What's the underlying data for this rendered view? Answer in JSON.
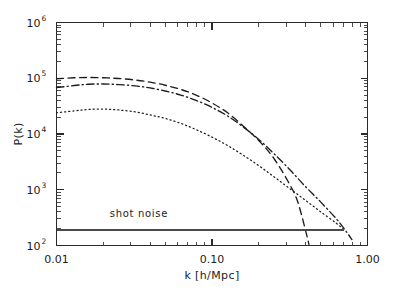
{
  "chart_data": {
    "type": "line",
    "title": "",
    "xlabel": "k [h/Mpc]",
    "ylabel": "P(k)",
    "xscale": "log",
    "yscale": "log",
    "xlim": [
      0.01,
      1.0
    ],
    "ylim": [
      100,
      1000000
    ],
    "grid": false,
    "legend_position": "none",
    "xtick_labels": [
      "0.01",
      "0.10",
      "1.00"
    ],
    "xtick_values": [
      0.01,
      0.1,
      1.0
    ],
    "ytick_labels": [
      "10",
      "10",
      "10",
      "10",
      "10"
    ],
    "ytick_exponents": [
      "2",
      "3",
      "4",
      "5",
      "6"
    ],
    "ytick_values": [
      100,
      1000,
      10000,
      100000,
      1000000
    ],
    "annotations": [
      {
        "text": "shot noise",
        "x": 0.022,
        "y": 320
      }
    ],
    "series": [
      {
        "name": "dashed-curve",
        "style": "dashed",
        "x": [
          0.01,
          0.013,
          0.016,
          0.02,
          0.025,
          0.032,
          0.04,
          0.05,
          0.063,
          0.079,
          0.1,
          0.126,
          0.158,
          0.2,
          0.251,
          0.316,
          0.355,
          0.398,
          0.42
        ],
        "y": [
          98000,
          102000,
          103000,
          102000,
          99000,
          93000,
          85000,
          75000,
          63000,
          50000,
          36000,
          24000,
          14000,
          7600,
          3600,
          1250,
          620,
          195,
          105
        ]
      },
      {
        "name": "dash-dot-curve",
        "style": "dashdot",
        "x": [
          0.01,
          0.013,
          0.016,
          0.02,
          0.025,
          0.032,
          0.04,
          0.05,
          0.063,
          0.079,
          0.1,
          0.126,
          0.158,
          0.2,
          0.251,
          0.316,
          0.398,
          0.501,
          0.631,
          0.708,
          0.794
        ],
        "y": [
          68000,
          74000,
          78000,
          79000,
          77000,
          73000,
          67000,
          59000,
          50000,
          40000,
          30000,
          21000,
          13500,
          8000,
          4400,
          2300,
          1150,
          600,
          300,
          200,
          128
        ]
      },
      {
        "name": "dotted-curve",
        "style": "dotted",
        "x": [
          0.01,
          0.013,
          0.016,
          0.02,
          0.025,
          0.032,
          0.04,
          0.05,
          0.063,
          0.079,
          0.1,
          0.126,
          0.158,
          0.2,
          0.251,
          0.316,
          0.398,
          0.501,
          0.631,
          0.708
        ],
        "y": [
          24000,
          26000,
          27500,
          28000,
          27000,
          25000,
          22000,
          19000,
          15500,
          12000,
          8800,
          6200,
          4200,
          2700,
          1700,
          1050,
          650,
          400,
          250,
          190
        ]
      },
      {
        "name": "shot-noise-line",
        "style": "solid",
        "x": [
          0.01,
          0.707
        ],
        "y": [
          190,
          190
        ]
      }
    ]
  }
}
